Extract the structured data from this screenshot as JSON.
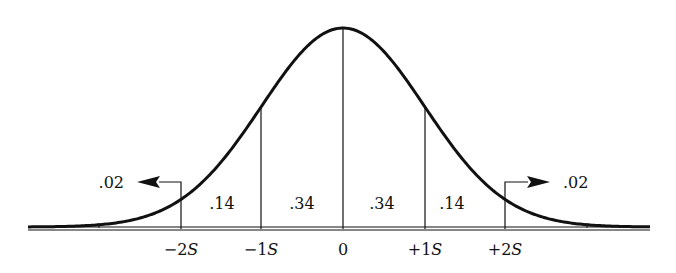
{
  "chart_data": {
    "type": "area",
    "title": "",
    "x_ticks": [
      "−2S",
      "−1S",
      "0",
      "+1S",
      "+2S"
    ],
    "x_values": [
      -2,
      -1,
      0,
      1,
      2
    ],
    "regions": [
      {
        "range": "< −2S",
        "proportion": ".02"
      },
      {
        "range": "−2S to −1S",
        "proportion": ".14"
      },
      {
        "range": "−1S to 0",
        "proportion": ".34"
      },
      {
        "range": "0 to +1S",
        "proportion": ".34"
      },
      {
        "range": "+1S to +2S",
        "proportion": ".14"
      },
      {
        "range": "> +2S",
        "proportion": ".02"
      }
    ],
    "xlabel": "",
    "ylabel": ""
  },
  "labels": {
    "tail_left": ".02",
    "region_m2_m1": ".14",
    "region_m1_0": ".34",
    "region_0_p1": ".34",
    "region_p1_p2": ".14",
    "tail_right": ".02"
  },
  "axis": {
    "m2_num": "−2",
    "m1_num": "−1",
    "zero": "0",
    "p1_num": "+1",
    "p2_num": "+2",
    "unit": "S"
  },
  "colors": {
    "line": "#111111",
    "background": "#ffffff"
  }
}
